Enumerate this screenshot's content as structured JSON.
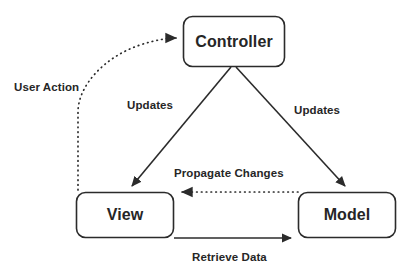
{
  "diagram": {
    "type": "flow-diagram",
    "background_color": "#ffffff",
    "stroke_color": "#2b2b2b",
    "text_color": "#262626",
    "nodes": [
      {
        "id": "controller",
        "label": "Controller",
        "shape": "rounded-rectangle"
      },
      {
        "id": "view",
        "label": "View",
        "shape": "rounded-rectangle"
      },
      {
        "id": "model",
        "label": "Model",
        "shape": "rounded-rectangle"
      }
    ],
    "edges": [
      {
        "id": "user-action",
        "label": "User Action",
        "from": "view",
        "to": "controller",
        "style": "dotted",
        "arrow": "single"
      },
      {
        "id": "updates-left",
        "label": "Updates",
        "from": "controller",
        "to": "view",
        "style": "solid",
        "arrow": "single"
      },
      {
        "id": "updates-right",
        "label": "Updates",
        "from": "controller",
        "to": "model",
        "style": "solid",
        "arrow": "single"
      },
      {
        "id": "propagate-changes",
        "label": "Propagate Changes",
        "from": "model",
        "to": "view",
        "style": "dotted",
        "arrow": "single"
      },
      {
        "id": "retrieve-data",
        "label": "Retrieve Data",
        "from": "view",
        "to": "model",
        "style": "solid",
        "arrow": "single"
      }
    ]
  }
}
